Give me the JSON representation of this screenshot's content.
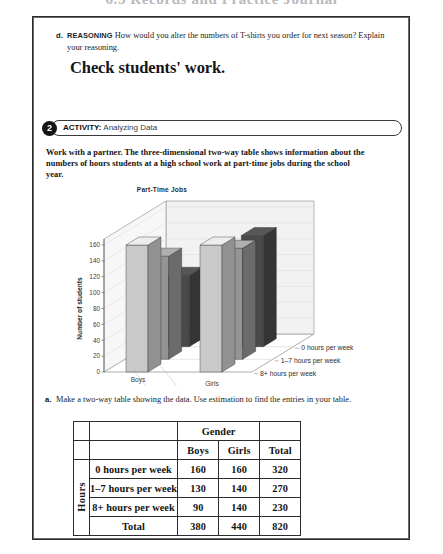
{
  "running_head": "6.3  Records and Practice Journal",
  "part_d": {
    "letter": "d.",
    "tag": "REASONING",
    "question": " How would you alter the numbers of T-shirts you order for next season? Explain your reasoning.",
    "answer": "Check students' work."
  },
  "activity": {
    "number": "2",
    "label": "ACTIVITY:",
    "title": " Analyzing Data"
  },
  "directions": "Work with a partner. The three-dimensional two-way table shows information about the numbers of hours students at a high school work at part-time jobs during the school year.",
  "part_a": {
    "letter": "a.",
    "text": "Make a two-way table showing the data. Use estimation to find the entries in your table."
  },
  "chart_data": {
    "type": "bar",
    "title": "Part-Time Jobs",
    "xlabel": "",
    "ylabel": "Number of students",
    "ylim": [
      0,
      160
    ],
    "yticks": [
      "0",
      "20",
      "40",
      "60",
      "80",
      "100",
      "120",
      "140",
      "160"
    ],
    "categories": [
      "Boys",
      "Girls"
    ],
    "depth_categories": [
      "0 hours per week",
      "1–7 hours per week",
      "8+ hours per week"
    ],
    "grid": true,
    "legend": "none",
    "series": [
      {
        "name": "0 hours per week",
        "values": [
          160,
          160
        ],
        "color": "#c9c9c9"
      },
      {
        "name": "1–7 hours per week",
        "values": [
          130,
          140
        ],
        "color": "#949494"
      },
      {
        "name": "8+ hours per week",
        "values": [
          90,
          140
        ],
        "color": "#4a4a4a"
      }
    ]
  },
  "table": {
    "gender_header": "Gender",
    "hours_spine": "Hours",
    "col_headers": [
      "Boys",
      "Girls",
      "Total"
    ],
    "rows": [
      {
        "label": "0 hours per week",
        "boys": "160",
        "girls": "160",
        "total": "320"
      },
      {
        "label": "1–7 hours per week",
        "boys": "130",
        "girls": "140",
        "total": "270"
      },
      {
        "label": "8+ hours per week",
        "boys": "90",
        "girls": "140",
        "total": "230"
      },
      {
        "label": "Total",
        "boys": "380",
        "girls": "440",
        "total": "820"
      }
    ]
  }
}
